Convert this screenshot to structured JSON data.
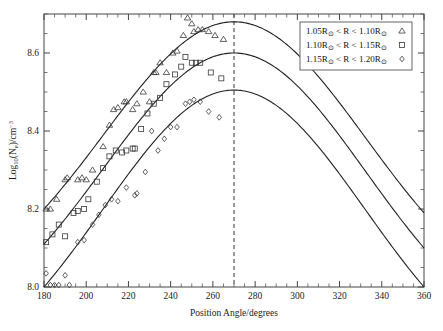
{
  "figure": {
    "background_color": "#ffffff",
    "frame_color": "#444444",
    "curve_color": "#222222",
    "marker_color": "#3a3a3a"
  },
  "chart_data": {
    "type": "scatter",
    "title": "",
    "xlabel": "Position Angle/degrees",
    "ylabel_parts": {
      "base": "Log",
      "base_sub": "10",
      "mid": "(N",
      "mid_sub": "e",
      "tail": ")/cm",
      "tail_sup": "-3",
      "full": "Log10(Ne)/cm-3"
    },
    "xlim": [
      180,
      360
    ],
    "ylim": [
      8.0,
      8.7
    ],
    "xticks": [
      180,
      200,
      220,
      240,
      260,
      280,
      300,
      320,
      340,
      360
    ],
    "xtick_labels": [
      "180",
      "200",
      "220",
      "240",
      "260",
      "280",
      "300",
      "320",
      "340",
      "360"
    ],
    "x_minor_interval": 5,
    "yticks": [
      8.0,
      8.2,
      8.4,
      8.6
    ],
    "ytick_labels": [
      "8.0",
      "8.2",
      "8.4",
      "8.6"
    ],
    "y_minor_interval": 0.05,
    "grid": false,
    "legend_position": "top-right",
    "annotations": [
      {
        "name": "vertical-reference-line",
        "type": "vline",
        "x": 270,
        "style": "dashed",
        "label": ""
      }
    ],
    "series": [
      {
        "name": "1.05Ro < R < 1.10Ro",
        "legend_label_parts": {
          "a": "1.05R",
          "a_sub": "o",
          "op1": " < R < ",
          "b": "1.10R",
          "b_sub": "o"
        },
        "marker": "triangle",
        "fit": {
          "type": "gaussian-like",
          "peak_x": 270,
          "peak_y": 8.68,
          "y_at_180": 8.2,
          "y_at_360": 8.19,
          "sigma": 62
        },
        "points": [
          [
            181,
            8.2
          ],
          [
            183,
            8.2
          ],
          [
            186,
            8.225
          ],
          [
            190,
            8.275
          ],
          [
            191,
            8.28
          ],
          [
            196,
            8.275
          ],
          [
            198,
            8.28
          ],
          [
            200,
            8.275
          ],
          [
            203,
            8.3
          ],
          [
            208,
            8.36
          ],
          [
            211,
            8.415
          ],
          [
            213,
            8.455
          ],
          [
            215,
            8.46
          ],
          [
            218,
            8.475
          ],
          [
            219,
            8.475
          ],
          [
            222,
            8.455
          ],
          [
            224,
            8.47
          ],
          [
            227,
            8.5
          ],
          [
            230,
            8.475
          ],
          [
            232,
            8.55
          ],
          [
            233,
            8.55
          ],
          [
            235,
            8.575
          ],
          [
            238,
            8.55
          ],
          [
            241,
            8.6
          ],
          [
            243,
            8.605
          ],
          [
            246,
            8.645
          ],
          [
            248,
            8.69
          ],
          [
            250,
            8.675
          ],
          [
            251,
            8.655
          ],
          [
            253,
            8.66
          ],
          [
            255,
            8.66
          ],
          [
            258,
            8.655
          ],
          [
            261,
            8.645
          ],
          [
            265,
            8.635
          ]
        ]
      },
      {
        "name": "1.10Ro < R < 1.15Ro",
        "legend_label_parts": {
          "a": "1.10R",
          "a_sub": "o",
          "op1": " < R < ",
          "b": "1.15R",
          "b_sub": "o"
        },
        "marker": "square",
        "fit": {
          "type": "gaussian-like",
          "peak_x": 270,
          "peak_y": 8.6,
          "y_at_180": 8.11,
          "y_at_360": 8.1,
          "sigma": 62
        },
        "points": [
          [
            181,
            8.115
          ],
          [
            184,
            8.135
          ],
          [
            187,
            8.16
          ],
          [
            190,
            8.13
          ],
          [
            194,
            8.19
          ],
          [
            196,
            8.195
          ],
          [
            199,
            8.2
          ],
          [
            201,
            8.225
          ],
          [
            205,
            8.27
          ],
          [
            208,
            8.305
          ],
          [
            211,
            8.335
          ],
          [
            214,
            8.35
          ],
          [
            217,
            8.345
          ],
          [
            219,
            8.35
          ],
          [
            222,
            8.355
          ],
          [
            223,
            8.355
          ],
          [
            226,
            8.405
          ],
          [
            229,
            8.445
          ],
          [
            232,
            8.47
          ],
          [
            235,
            8.485
          ],
          [
            238,
            8.52
          ],
          [
            242,
            8.545
          ],
          [
            245,
            8.565
          ],
          [
            247,
            8.59
          ],
          [
            250,
            8.575
          ],
          [
            252,
            8.575
          ],
          [
            254,
            8.575
          ],
          [
            259,
            8.55
          ],
          [
            264,
            8.535
          ]
        ]
      },
      {
        "name": "1.15Ro < R < 1.20Ro",
        "legend_label_parts": {
          "a": "1.15R",
          "a_sub": "o",
          "op1": " < R < ",
          "b": "1.20R",
          "b_sub": "o"
        },
        "marker": "diamond",
        "fit": {
          "type": "gaussian-like",
          "peak_x": 270,
          "peak_y": 8.505,
          "y_at_180": 8.0,
          "y_at_360": 8.0,
          "sigma": 62
        },
        "points": [
          [
            181,
            8.035
          ],
          [
            183,
            8.005
          ],
          [
            185,
            8.005
          ],
          [
            187,
            8.005
          ],
          [
            190,
            8.03
          ],
          [
            192,
            8.005
          ],
          [
            196,
            8.115
          ],
          [
            199,
            8.12
          ],
          [
            203,
            8.16
          ],
          [
            206,
            8.185
          ],
          [
            209,
            8.21
          ],
          [
            212,
            8.225
          ],
          [
            215,
            8.22
          ],
          [
            219,
            8.255
          ],
          [
            223,
            8.235
          ],
          [
            224,
            8.24
          ],
          [
            228,
            8.295
          ],
          [
            231,
            8.4
          ],
          [
            234,
            8.35
          ],
          [
            237,
            8.38
          ],
          [
            240,
            8.41
          ],
          [
            243,
            8.41
          ],
          [
            247,
            8.47
          ],
          [
            249,
            8.475
          ],
          [
            251,
            8.48
          ],
          [
            254,
            8.475
          ],
          [
            258,
            8.45
          ],
          [
            263,
            8.435
          ]
        ]
      }
    ]
  }
}
